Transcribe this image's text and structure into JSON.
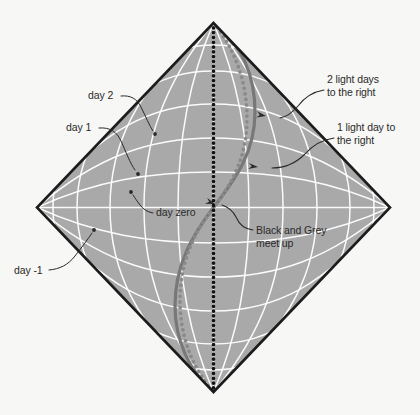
{
  "figure": {
    "background_color": "#f7f7f5",
    "diamond_fill_color": "#a9a9a9",
    "diamond_edge_color": "#1c1c1c",
    "grid_line_color": "#ffffff",
    "text_color": "#2a2a2a",
    "black_worldline_color": "#141414",
    "grey_worldline_color": "#8a8a8a",
    "solid_curve_color": "#787878"
  },
  "annotations": [
    {
      "id": "day-2",
      "lines": [
        "day 2"
      ],
      "text_x": 88,
      "text_y": 99,
      "anchor": "start",
      "leader": "M 121 96 C 131 95, 137 99, 141 107 C 146 117, 149 125, 153 131",
      "dot_x": 155,
      "dot_y": 134,
      "dot_r": 1.9
    },
    {
      "id": "day-1",
      "lines": [
        "day 1"
      ],
      "text_x": 66,
      "text_y": 131,
      "anchor": "start",
      "leader": "M 99 128 C 110 127, 117 132, 121 141 C 126 152, 130 163, 135 170",
      "dot_x": 138,
      "dot_y": 174,
      "dot_r": 1.9
    },
    {
      "id": "day-zero",
      "lines": [
        "day zero"
      ],
      "text_x": 156,
      "text_y": 216,
      "anchor": "start",
      "leader": "M 153 213 C 147 212, 143 209, 140 205 C 137 201, 135 198, 133 195",
      "dot_x": 131,
      "dot_y": 192,
      "dot_r": 1.9
    },
    {
      "id": "day-minus-1",
      "lines": [
        "day -1"
      ],
      "text_x": 14,
      "text_y": 274,
      "anchor": "start",
      "leader": "M 49 270 C 60 269, 68 265, 75 256 C 82 247, 88 239, 92 233",
      "dot_x": 94,
      "dot_y": 230,
      "dot_r": 1.9
    },
    {
      "id": "two-light-days",
      "lines": [
        "2 light days",
        "to the right"
      ],
      "text_x": 327,
      "text_y": 83,
      "anchor": "start",
      "leader": "M 324 90 C 312 92, 304 98, 298 106 C 292 113, 286 117, 280 118",
      "dot_x": 266,
      "dot_y": 116,
      "dot_r": 0,
      "arrow": true,
      "arrow_angle": 190
    },
    {
      "id": "one-light-day",
      "lines": [
        "1 light day to",
        "the right"
      ],
      "text_x": 337,
      "text_y": 131,
      "anchor": "start",
      "leader": "M 334 138 C 320 140, 312 146, 305 154, 296 163, 284 168, 272 168",
      "dot_x": 258,
      "dot_y": 167,
      "dot_r": 0,
      "arrow": true,
      "arrow_angle": 186
    },
    {
      "id": "black-grey-meet",
      "lines": [
        "Black and Grey",
        "meet up"
      ],
      "text_x": 256,
      "text_y": 234,
      "anchor": "start",
      "leader": "M 253 230 C 244 229, 239 224, 236 217 C 233 211, 228 207, 222 205",
      "dot_x": 215,
      "dot_y": 204,
      "dot_r": 0,
      "arrow": true,
      "arrow_angle": 200
    }
  ],
  "diagram_geometry": {
    "center_x": 213.5,
    "center_y": 207.5,
    "half_width": 176.5,
    "half_height": 184.5,
    "top_apex": [
      213.5,
      23
    ],
    "bottom_apex": [
      213.5,
      392
    ],
    "left_vertex": [
      37,
      207.5
    ],
    "right_vertex": [
      390,
      207.5
    ]
  },
  "chart_data": {
    "type": "line",
    "xlabel": "space (light days to the right)",
    "ylabel": "time (days)",
    "grid": true,
    "legend_position": "none",
    "time_gridlines_labeled": [
      "day -1",
      "day zero",
      "day 1",
      "day 2"
    ],
    "space_gridlines_labeled": [
      "1 light day to the right",
      "2 light days to the right"
    ],
    "time_gridline_values": [
      -3,
      -2,
      -1,
      0,
      1,
      2,
      3
    ],
    "space_gridline_values": [
      -3,
      -2,
      -1,
      0,
      1,
      2,
      3
    ],
    "series": [
      {
        "name": "Black worldline",
        "style": "dotted",
        "color": "#141414",
        "description": "Stationary observer: straight vertical dotted line from bottom apex to top apex through the centre"
      },
      {
        "name": "Grey worldline",
        "style": "dotted",
        "color": "#8a8a8a",
        "description": "Traveller: S-shaped dotted curve crossing the black line at the centre (day zero)"
      },
      {
        "name": "Grey solid curve",
        "style": "solid",
        "color": "#787878",
        "description": "Accelerated traveller path bulging right above the centre and left below it, meeting both apexes"
      }
    ],
    "annotations": [
      "day 2",
      "day 1",
      "day zero",
      "day -1",
      "2 light days to the right",
      "1 light day to the right",
      "Black and Grey meet up"
    ]
  }
}
